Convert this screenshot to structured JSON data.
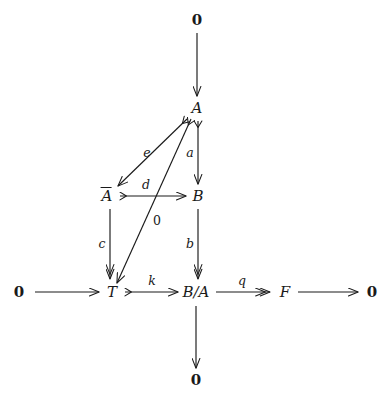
{
  "diagram": {
    "type": "commutative-diagram",
    "background_color": "#ffffff",
    "ink_color": "#1a1a1a",
    "nodes": [
      {
        "id": "zero-top",
        "label": "0",
        "kind": "zero",
        "x": 197,
        "y": 20
      },
      {
        "id": "A",
        "label": "A",
        "kind": "object",
        "x": 197,
        "y": 108
      },
      {
        "id": "Abar",
        "label": "A",
        "kind": "object",
        "overbar": true,
        "x": 107,
        "y": 196
      },
      {
        "id": "B",
        "label": "B",
        "kind": "object",
        "x": 198,
        "y": 196
      },
      {
        "id": "zero-left",
        "label": "0",
        "kind": "zero",
        "x": 19,
        "y": 292
      },
      {
        "id": "T",
        "label": "T",
        "kind": "object",
        "x": 112,
        "y": 292
      },
      {
        "id": "B-over-A",
        "label": "B/A",
        "kind": "object",
        "x": 196,
        "y": 292
      },
      {
        "id": "F",
        "label": "F",
        "kind": "object",
        "x": 285,
        "y": 292
      },
      {
        "id": "zero-right",
        "label": "0",
        "kind": "zero",
        "x": 372,
        "y": 292
      },
      {
        "id": "zero-bottom",
        "label": "0",
        "kind": "zero",
        "x": 196,
        "y": 380
      }
    ],
    "arrows": [
      {
        "id": "zero-top-to-A",
        "from": "zero-top",
        "to": "A",
        "label": "",
        "tail": "plain",
        "head": "single"
      },
      {
        "id": "A-to-B",
        "from": "A",
        "to": "B",
        "label": "a",
        "tail": "monic",
        "head": "single"
      },
      {
        "id": "A-to-Abar",
        "from": "A",
        "to": "Abar",
        "label": "e",
        "tail": "monic",
        "head": "single"
      },
      {
        "id": "A-to-T",
        "from": "A",
        "to": "T",
        "label": "0",
        "tail": "monic",
        "head": "single"
      },
      {
        "id": "Abar-to-B",
        "from": "Abar",
        "to": "B",
        "label": "d",
        "tail": "monic",
        "head": "single"
      },
      {
        "id": "Abar-to-T",
        "from": "Abar",
        "to": "T",
        "label": "c",
        "tail": "plain",
        "head": "double"
      },
      {
        "id": "B-to-B-over-A",
        "from": "B",
        "to": "B-over-A",
        "label": "b",
        "tail": "plain",
        "head": "double"
      },
      {
        "id": "zero-left-to-T",
        "from": "zero-left",
        "to": "T",
        "label": "",
        "tail": "plain",
        "head": "single"
      },
      {
        "id": "T-to-B-over-A",
        "from": "T",
        "to": "B-over-A",
        "label": "k",
        "tail": "monic",
        "head": "single"
      },
      {
        "id": "B-over-A-to-F",
        "from": "B-over-A",
        "to": "F",
        "label": "q",
        "tail": "plain",
        "head": "double"
      },
      {
        "id": "F-to-zero-right",
        "from": "F",
        "to": "zero-right",
        "label": "",
        "tail": "plain",
        "head": "single"
      },
      {
        "id": "B-over-A-to-zero",
        "from": "B-over-A",
        "to": "zero-bottom",
        "label": "",
        "tail": "plain",
        "head": "single"
      }
    ],
    "arrow_labels": [
      {
        "id": "label-a",
        "text": "a",
        "style": "italic",
        "x": 190,
        "y": 153
      },
      {
        "id": "label-e",
        "text": "e",
        "style": "italic",
        "x": 147,
        "y": 153
      },
      {
        "id": "label-d",
        "text": "d",
        "style": "italic",
        "x": 146,
        "y": 185
      },
      {
        "id": "label-0-diag",
        "text": "0",
        "style": "plain",
        "x": 157,
        "y": 221
      },
      {
        "id": "label-c",
        "text": "c",
        "style": "italic",
        "x": 102,
        "y": 244
      },
      {
        "id": "label-b",
        "text": "b",
        "style": "italic",
        "x": 190,
        "y": 244
      },
      {
        "id": "label-k",
        "text": "k",
        "style": "italic",
        "x": 152,
        "y": 281
      },
      {
        "id": "label-q",
        "text": "q",
        "style": "italic",
        "x": 242,
        "y": 281
      }
    ]
  }
}
